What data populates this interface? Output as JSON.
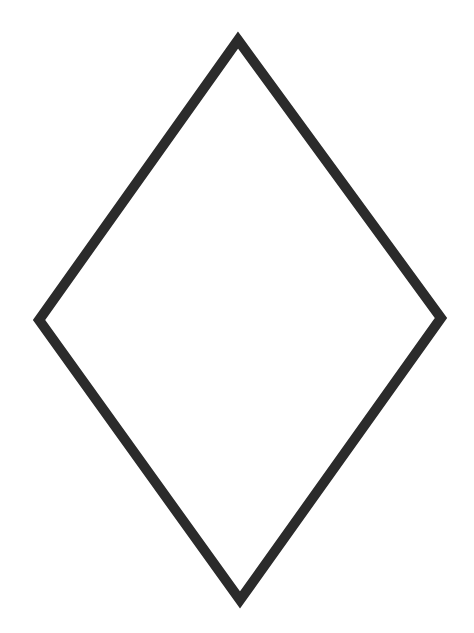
{
  "figure": {
    "shape": "rhombus",
    "stroke_color": "#2b2b2b",
    "fill_color": "#ffffff",
    "background_color": "#ffffff",
    "stroke_width": 10,
    "vertices": {
      "top": [
        238,
        40
      ],
      "right": [
        441,
        318
      ],
      "bottom": [
        240,
        600
      ],
      "left": [
        39,
        320
      ]
    }
  }
}
